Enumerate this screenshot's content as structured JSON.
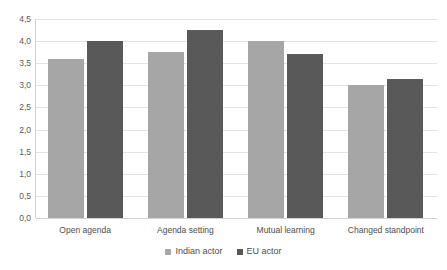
{
  "chart_data": {
    "type": "bar",
    "title": "",
    "subtitle": "",
    "xlabel": "",
    "ylabel": "",
    "categories": [
      "Open agenda",
      "Agenda setting",
      "Mutual learning",
      "Changed standpoint"
    ],
    "series": [
      {
        "name": "Indian actor",
        "color": "#a6a6a6",
        "values": [
          3.6,
          3.75,
          4.0,
          3.0
        ]
      },
      {
        "name": "EU actor",
        "color": "#595959",
        "values": [
          4.0,
          4.25,
          3.7,
          3.15
        ]
      }
    ],
    "ylim": [
      0,
      4.5
    ],
    "ytick_values": [
      0,
      0.5,
      1.0,
      1.5,
      2.0,
      2.5,
      3.0,
      3.5,
      4.0,
      4.5
    ],
    "ytick_labels": [
      "0,0",
      "0,5",
      "1,0",
      "1,5",
      "2,0",
      "2,5",
      "3,0",
      "3,5",
      "4,0",
      "4,5"
    ],
    "decimal_separator": ",",
    "grid": true,
    "grid_axis": "y",
    "legend_position": "bottom",
    "legend_marker": "square",
    "background_color": "#ffffff",
    "gridline_color": "#e2e2e2",
    "axis_color": "#d0d0d0",
    "text_color": "#4d4d4d"
  }
}
